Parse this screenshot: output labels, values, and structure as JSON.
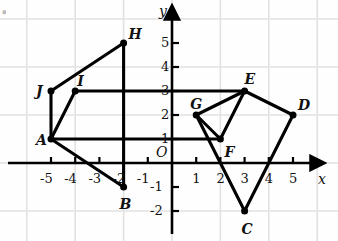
{
  "figure": {
    "axis_labels": {
      "x": "x",
      "y": "y",
      "origin": "O"
    },
    "grid": {
      "visible": true,
      "spacing_units": 2,
      "color": "#e2e2e2"
    },
    "axis_color": "#000000",
    "curve_color": "#000000",
    "x_ticks": [
      "-5",
      "-4",
      "-3",
      "-2",
      "-1",
      "1",
      "2",
      "3",
      "4",
      "5"
    ],
    "y_ticks": [
      "-2",
      "-1",
      "1",
      "2",
      "3",
      "4",
      "5"
    ],
    "xlim": [
      -6,
      6
    ],
    "ylim": [
      -3,
      6
    ]
  },
  "chart_data": {
    "type": "scatter",
    "title": "",
    "xlabel": "x",
    "ylabel": "y",
    "xlim": [
      -6,
      6
    ],
    "ylim": [
      -3,
      6
    ],
    "grid": true,
    "legend": "none",
    "points": [
      {
        "label": "A",
        "x": -5,
        "y": 1,
        "label_dx": -15,
        "label_dy": -6
      },
      {
        "label": "B",
        "x": -2,
        "y": -1,
        "label_dx": -4,
        "label_dy": 10
      },
      {
        "label": "C",
        "x": 3,
        "y": -2,
        "label_dx": -3,
        "label_dy": 11
      },
      {
        "label": "D",
        "x": 5,
        "y": 2,
        "label_dx": 5,
        "label_dy": -17
      },
      {
        "label": "E",
        "x": 3,
        "y": 3,
        "label_dx": 0,
        "label_dy": -19
      },
      {
        "label": "F",
        "x": 2,
        "y": 1,
        "label_dx": 4,
        "label_dy": 6
      },
      {
        "label": "G",
        "x": 1,
        "y": 2,
        "label_dx": -6,
        "label_dy": -18
      },
      {
        "label": "H",
        "x": -2,
        "y": 5,
        "label_dx": 5,
        "label_dy": -16
      },
      {
        "label": "I",
        "x": -4,
        "y": 3,
        "label_dx": 2,
        "label_dy": -17
      },
      {
        "label": "J",
        "x": -5,
        "y": 3,
        "label_dx": -15,
        "label_dy": -7
      }
    ],
    "segments": [
      {
        "name": "J-H",
        "from": [
          -5,
          3
        ],
        "to": [
          -2,
          5
        ]
      },
      {
        "name": "H-B",
        "from": [
          -2,
          5
        ],
        "to": [
          -2,
          -1
        ]
      },
      {
        "name": "J-A",
        "from": [
          -5,
          3
        ],
        "to": [
          -5,
          1
        ]
      },
      {
        "name": "A-I",
        "from": [
          -5,
          1
        ],
        "to": [
          -4,
          3
        ]
      },
      {
        "name": "I-E",
        "from": [
          -4,
          3
        ],
        "to": [
          3,
          3
        ]
      },
      {
        "name": "A-F",
        "from": [
          -5,
          1
        ],
        "to": [
          2,
          1
        ]
      },
      {
        "name": "A-B",
        "from": [
          -5,
          1
        ],
        "to": [
          -2,
          -1
        ]
      },
      {
        "name": "G-E",
        "from": [
          1,
          2
        ],
        "to": [
          3,
          3
        ]
      },
      {
        "name": "G-F",
        "from": [
          1,
          2
        ],
        "to": [
          2,
          1
        ]
      },
      {
        "name": "F-E",
        "from": [
          2,
          1
        ],
        "to": [
          3,
          3
        ]
      },
      {
        "name": "G-C",
        "from": [
          1,
          2
        ],
        "to": [
          3,
          -2
        ]
      },
      {
        "name": "C-D",
        "from": [
          3,
          -2
        ],
        "to": [
          5,
          2
        ]
      },
      {
        "name": "D-E",
        "from": [
          5,
          2
        ],
        "to": [
          3,
          3
        ]
      }
    ],
    "polygons": [
      {
        "name": "left-figure",
        "vertices": [
          "A",
          "B",
          "H",
          "I",
          "J"
        ]
      },
      {
        "name": "right-figure",
        "vertices": [
          "C",
          "D",
          "E",
          "F",
          "G"
        ]
      }
    ]
  }
}
